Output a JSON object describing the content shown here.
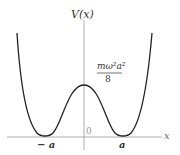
{
  "diagram": {
    "title": "V(x)",
    "x_axis_label": "x",
    "origin_label": "0",
    "peak_label_numerator": "mω²a²",
    "peak_label_denominator": "8",
    "minima_labels": [
      "− a",
      "a"
    ],
    "curve_description": "Double-well potential with minima at x = ±a and local maximum mω²a²/8 at x = 0"
  }
}
